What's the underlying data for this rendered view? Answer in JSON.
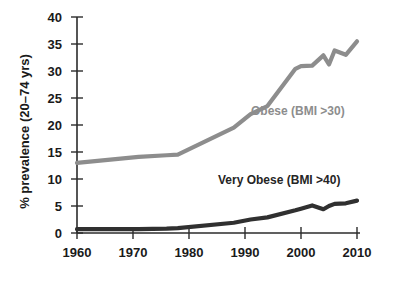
{
  "chart_data": {
    "type": "line",
    "title": "",
    "xlabel": "",
    "ylabel": "% prevalence (20–74 yrs)",
    "xlim": [
      1960,
      2010
    ],
    "ylim": [
      0,
      40
    ],
    "xticks": [
      "1960",
      "1970",
      "1980",
      "1990",
      "2000",
      "2010"
    ],
    "yticks": [
      "0",
      "5",
      "10",
      "15",
      "20",
      "25",
      "30",
      "35",
      "40"
    ],
    "grid": false,
    "legend_position": "inline-annotation",
    "series": [
      {
        "name": "Obese (BMI >30)",
        "color": "#8d8d8d",
        "x": [
          1960,
          1971,
          1976,
          1978,
          1988,
          1991,
          1994,
          1999,
          2000,
          2002,
          2004,
          2005,
          2006,
          2008,
          2010
        ],
        "values": [
          13.0,
          14.1,
          14.4,
          14.5,
          19.5,
          22.0,
          23.5,
          30.4,
          30.9,
          31.0,
          32.9,
          31.2,
          33.8,
          33.0,
          35.5
        ]
      },
      {
        "name": "Very Obese (BMI >40)",
        "color": "#303030",
        "x": [
          1960,
          1971,
          1976,
          1978,
          1988,
          1991,
          1994,
          1999,
          2000,
          2002,
          2004,
          2005,
          2006,
          2008,
          2010
        ],
        "values": [
          0.7,
          0.7,
          0.8,
          0.9,
          1.9,
          2.5,
          2.9,
          4.2,
          4.5,
          5.1,
          4.4,
          5.0,
          5.4,
          5.5,
          6.0
        ]
      }
    ],
    "annotations": [
      {
        "text": "Obese (BMI >30)",
        "color": "#8d8d8d"
      },
      {
        "text": "Very Obese (BMI >40)",
        "color": "#252525"
      }
    ]
  },
  "axes": {
    "y_title": "% prevalence (20–74 yrs)",
    "y_labels": [
      "40",
      "35",
      "30",
      "25",
      "20",
      "15",
      "10",
      "5",
      "0"
    ],
    "x_labels": [
      "1960",
      "1970",
      "1980",
      "1990",
      "2000",
      "2010"
    ]
  },
  "colors": {
    "obese_line": "#8d8d8d",
    "very_obese_line": "#303030",
    "axis": "#2b2b2b",
    "text": "#1a1a1a",
    "background": "#ffffff"
  }
}
